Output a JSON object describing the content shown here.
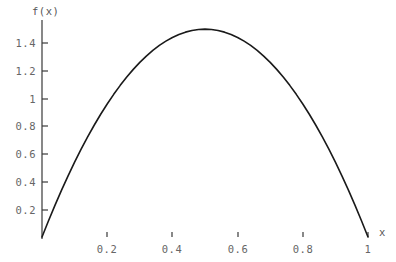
{
  "chart_data": {
    "type": "line",
    "title": "",
    "subtitle": "",
    "xlabel": "x",
    "ylabel": "f(x)",
    "function": "f(x) = 6x(1-x)",
    "xlim": [
      0,
      1.06
    ],
    "ylim": [
      0,
      1.57
    ],
    "grid": false,
    "legend": null,
    "legend_position": "none",
    "annotations": [],
    "xticks": [
      0.2,
      0.4,
      0.6,
      0.8,
      1
    ],
    "xtick_labels": [
      "0.2",
      "0.4",
      "0.6",
      "0.8",
      "1"
    ],
    "yticks": [
      0.2,
      0.4,
      0.6,
      0.8,
      1,
      1.2,
      1.4
    ],
    "ytick_labels": [
      "0.2",
      "0.4",
      "0.6",
      "0.8",
      "1",
      "1.2",
      "1.4"
    ],
    "peak": {
      "x": 0.5,
      "y": 1.5
    },
    "x": [
      0,
      0.02,
      0.04,
      0.06,
      0.08,
      0.1,
      0.12,
      0.14,
      0.16,
      0.18,
      0.2,
      0.22,
      0.24,
      0.26,
      0.28,
      0.3,
      0.32,
      0.34,
      0.36,
      0.38,
      0.4,
      0.42,
      0.44,
      0.46,
      0.48,
      0.5,
      0.52,
      0.54,
      0.56,
      0.58,
      0.6,
      0.62,
      0.64,
      0.66,
      0.68,
      0.7,
      0.72,
      0.74,
      0.76,
      0.78,
      0.8,
      0.82,
      0.84,
      0.86,
      0.88,
      0.9,
      0.92,
      0.94,
      0.96,
      0.98,
      1
    ],
    "y": [
      0,
      0.1176,
      0.2304,
      0.3384,
      0.4416,
      0.54,
      0.6336,
      0.7224,
      0.8064,
      0.8856,
      0.96,
      1.0296,
      1.0944,
      1.1544,
      1.2096,
      1.26,
      1.3056,
      1.3464,
      1.3824,
      1.4136,
      1.44,
      1.4616,
      1.4784,
      1.4904,
      1.4976,
      1.5,
      1.4976,
      1.4904,
      1.4784,
      1.4616,
      1.44,
      1.4136,
      1.3824,
      1.3464,
      1.3056,
      1.26,
      1.2096,
      1.1544,
      1.0944,
      1.0296,
      0.96,
      0.8856,
      0.8064,
      0.7224,
      0.6336,
      0.54,
      0.4416,
      0.3384,
      0.2304,
      0.1176,
      0
    ],
    "series": [
      {
        "name": "f(x) = 6x(1-x)",
        "color": "#1a1a1a",
        "linewidth": 1.6
      }
    ]
  },
  "axes": {
    "x_axis_label": "x",
    "y_axis_label": "f(x)",
    "x_axis_color_left": "#4a7a78",
    "x_axis_color_right": "#7a3030",
    "y_axis_color": "#555555",
    "tick_color": "#444444",
    "tick_label_color": "#666666",
    "curve_color": "#1a1a1a",
    "background": "#ffffff"
  },
  "ytick_positions_px": [
    {
      "label": "1.4",
      "y": 43
    },
    {
      "label": "1.2",
      "y": 71
    },
    {
      "label": "1",
      "y": 99
    },
    {
      "label": "0.8",
      "y": 126
    },
    {
      "label": "0.6",
      "y": 154
    },
    {
      "label": "0.4",
      "y": 182
    },
    {
      "label": "0.2",
      "y": 210
    }
  ],
  "xtick_positions_px": [
    {
      "label": "0.2",
      "x": 107
    },
    {
      "label": "0.4",
      "x": 172
    },
    {
      "label": "0.6",
      "x": 238
    },
    {
      "label": "0.8",
      "x": 303
    },
    {
      "label": "1",
      "x": 368
    }
  ]
}
